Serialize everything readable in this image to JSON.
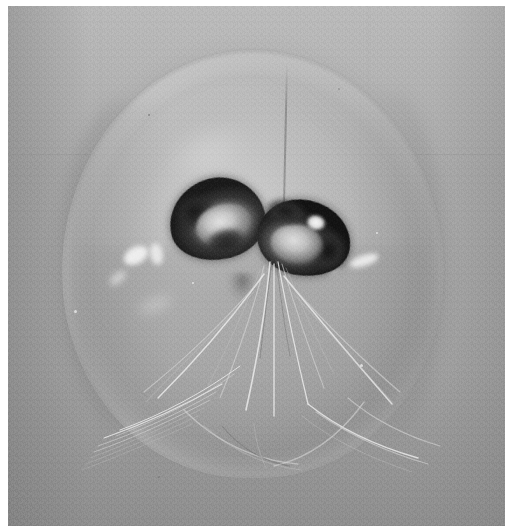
{
  "image": {
    "title": "Gelatinous marine organism photographed against a plain grey background",
    "kind": "black-and-white photograph",
    "subject": "transparent jellyfish-like bell specimen",
    "caption": "",
    "palette": {
      "background_grey": "#a6a8a6",
      "background_light": "#b4b6b4",
      "background_dark": "#909290",
      "bell_body": "#bcbebc",
      "bell_edge": "#8c8e8c",
      "organ_dark": "#1b1d1b",
      "organ_mid": "#6e706e",
      "organ_light": "#d6d8d6",
      "highlight_white": "#f2f4f2",
      "filament": "#e8eae8",
      "paper_margin": "#ffffff"
    },
    "geometry": {
      "canvas_width": 519,
      "canvas_height": 526,
      "print_left": 8,
      "print_top": 6,
      "print_width": 497,
      "print_height": 520,
      "bell_left": 62,
      "bell_top": 50,
      "bell_width": 382,
      "bell_height": 428
    },
    "features": [
      {
        "name": "bell",
        "label": "translucent dome-shaped bell",
        "interactable": false
      },
      {
        "name": "organ-left",
        "label": "left dark lobed organ",
        "interactable": false
      },
      {
        "name": "organ-right",
        "label": "right dark lobed organ",
        "interactable": false
      },
      {
        "name": "midline",
        "label": "vertical midline fold",
        "interactable": false
      },
      {
        "name": "tentacles",
        "label": "fine translucent tentacle filaments",
        "interactable": false
      },
      {
        "name": "highlights",
        "label": "specular light reflections on the bell",
        "interactable": false
      }
    ]
  }
}
